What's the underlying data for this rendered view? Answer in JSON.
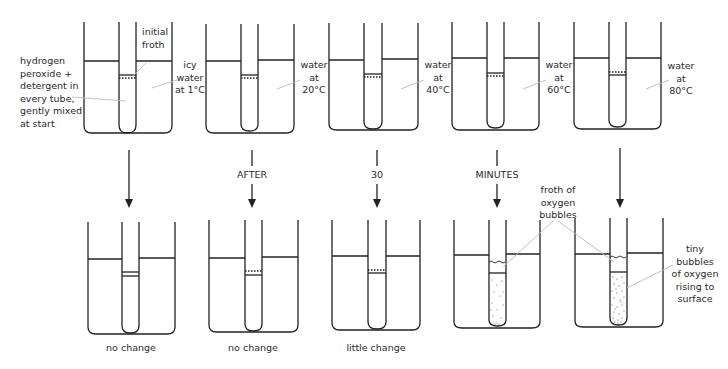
{
  "diagram": {
    "start_label": [
      "hydrogen",
      "peroxide +",
      "detergent in",
      "every tube,",
      "gently mixed",
      "at start"
    ],
    "initial_froth_label": [
      "initial",
      "froth"
    ],
    "top_row": [
      {
        "condition": [
          "icy",
          "water",
          "at 1°C"
        ]
      },
      {
        "condition": [
          "water",
          "at",
          "20°C"
        ]
      },
      {
        "condition": [
          "water",
          "at",
          "40°C"
        ]
      },
      {
        "condition": [
          "water",
          "at",
          "60°C"
        ]
      },
      {
        "condition": [
          "water",
          "at",
          "80°C"
        ]
      }
    ],
    "time_labels": [
      "AFTER",
      "30",
      "MINUTES"
    ],
    "bottom_row": [
      {
        "result": "no change"
      },
      {
        "result": "no change"
      },
      {
        "result": "little change"
      },
      {
        "result": ""
      },
      {
        "result": ""
      }
    ],
    "froth_label": [
      "froth of",
      "oxygen",
      "bubbles"
    ],
    "bubbles_label": [
      "tiny",
      "bubbles",
      "of oxygen",
      "rising to",
      "surface"
    ],
    "colors": {
      "line": "#222222",
      "leader": "#bbbbbb",
      "text": "#2a2a2a"
    }
  }
}
